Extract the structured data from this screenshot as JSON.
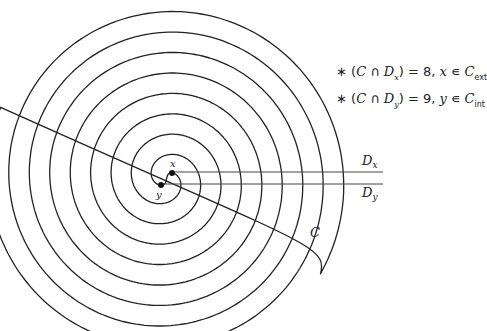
{
  "figure": {
    "curve_label": "C",
    "center": [
      166,
      179
    ],
    "spiral": {
      "ring_spacing_px": 20.5,
      "turns": 4,
      "arm_x_start_radius": 9,
      "arm_y_start_radius": 9,
      "outer_endcap": {
        "inner_x": 307,
        "outer_x": 328,
        "bottom_y": 243
      }
    },
    "points": {
      "x": {
        "label": "x",
        "pos": [
          172,
          173
        ]
      },
      "y": {
        "label": "y",
        "pos": [
          161,
          185
        ]
      }
    },
    "rays": [
      {
        "name": "D_x",
        "label_main": "D",
        "label_sub": "x",
        "y": 172,
        "x_end": 383
      },
      {
        "name": "D_y",
        "label_main": "D",
        "label_sub": "y",
        "y": 184,
        "x_end": 383
      }
    ]
  },
  "legend": {
    "items": [
      {
        "bullet": "∗",
        "open": "(",
        "set": "C",
        "cap": " ∩ ",
        "ray": "D",
        "ray_sub": "x",
        "close": ")",
        "eq": " = 8, ",
        "pt": "x",
        "in": " ∊ ",
        "region": "C",
        "region_sub": "ext"
      },
      {
        "bullet": "∗",
        "open": "(",
        "set": "C",
        "cap": " ∩ ",
        "ray": "D",
        "ray_sub": "y",
        "close": ")",
        "eq": " = 9, ",
        "pt": "y",
        "in": " ∊ ",
        "region": "C",
        "region_sub": "int"
      }
    ]
  },
  "colors": {
    "ink": "#222222",
    "background": "#ffffff"
  }
}
